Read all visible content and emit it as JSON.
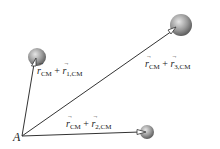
{
  "diagram": {
    "point_label": "A",
    "vectors": [
      {
        "id": 1,
        "r": "r",
        "base_sub": "CM",
        "plus": "+",
        "rel_sub": "1,CM"
      },
      {
        "id": 2,
        "r": "r",
        "base_sub": "CM",
        "plus": "+",
        "rel_sub": "2,CM"
      },
      {
        "id": 3,
        "r": "r",
        "base_sub": "CM",
        "plus": "+",
        "rel_sub": "3,CM"
      }
    ],
    "colors": {
      "line": "#333333",
      "sphere_light": "#d8d8d8",
      "sphere_dark": "#6e6e6e"
    }
  }
}
